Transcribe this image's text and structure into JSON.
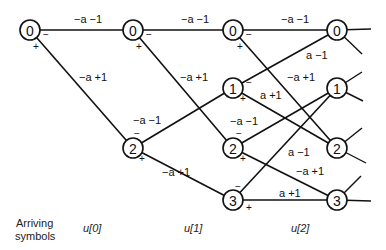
{
  "diagram": {
    "type": "trellis",
    "nodes": [
      {
        "id": "c0n0",
        "label": "0",
        "x": 30,
        "y": 30
      },
      {
        "id": "c1n0",
        "label": "0",
        "x": 133,
        "y": 30
      },
      {
        "id": "c1n2",
        "label": "2",
        "x": 133,
        "y": 148
      },
      {
        "id": "c2n0",
        "label": "0",
        "x": 233,
        "y": 30
      },
      {
        "id": "c2n1",
        "label": "1",
        "x": 233,
        "y": 88
      },
      {
        "id": "c2n2",
        "label": "2",
        "x": 233,
        "y": 148
      },
      {
        "id": "c2n3",
        "label": "3",
        "x": 233,
        "y": 200
      },
      {
        "id": "c3n0",
        "label": "0",
        "x": 337,
        "y": 30
      },
      {
        "id": "c3n1",
        "label": "1",
        "x": 337,
        "y": 88
      },
      {
        "id": "c3n2",
        "label": "2",
        "x": 337,
        "y": 148
      },
      {
        "id": "c3n3",
        "label": "3",
        "x": 337,
        "y": 200
      }
    ],
    "edges": [
      {
        "from": "c0n0",
        "to": "c1n0",
        "label": "−a −1"
      },
      {
        "from": "c0n0",
        "to": "c1n2",
        "label": "−a +1"
      },
      {
        "from": "c1n0",
        "to": "c2n0",
        "label": "−a −1"
      },
      {
        "from": "c1n0",
        "to": "c2n2",
        "label": "−a +1"
      },
      {
        "from": "c1n2",
        "to": "c2n1",
        "label": "−a −1"
      },
      {
        "from": "c1n2",
        "to": "c2n3",
        "label": "−a +1"
      },
      {
        "from": "c2n0",
        "to": "c3n0",
        "label": "−a −1"
      },
      {
        "from": "c2n0",
        "to": "c3n2",
        "label": "−a +1"
      },
      {
        "from": "c2n1",
        "to": "c3n0",
        "label": "a −1"
      },
      {
        "from": "c2n1",
        "to": "c3n2",
        "label": "a +1"
      },
      {
        "from": "c2n2",
        "to": "c3n1",
        "label": "−a −1"
      },
      {
        "from": "c2n2",
        "to": "c3n3",
        "label": "−a +1"
      },
      {
        "from": "c2n3",
        "to": "c3n1",
        "label": "a −1"
      },
      {
        "from": "c2n3",
        "to": "c3n3",
        "label": "a +1"
      }
    ],
    "signs": {
      "minus": "−",
      "plus": "+"
    },
    "footer": {
      "arriving_line1": "Arriving",
      "arriving_line2": "symbols",
      "u0": "u[0]",
      "u1": "u[1]",
      "u2": "u[2]"
    },
    "labels": {
      "e1": "−a −1",
      "e2": "−a +1",
      "e3": "−a −1",
      "e4": "−a +1",
      "e5": "−a −1",
      "e6": "−a +1",
      "e7": "−a −1",
      "e8": "a −1",
      "e9": "−a +1",
      "e10": "a +1",
      "e11": "−a −1",
      "e12": "a −1",
      "e13": "−a +1",
      "e14": "a +1"
    },
    "node_labels": {
      "c0n0": "0",
      "c1n0": "0",
      "c1n2": "2",
      "c2n0": "0",
      "c2n1": "1",
      "c2n2": "2",
      "c2n3": "3",
      "c3n0": "0",
      "c3n1": "1",
      "c3n2": "2",
      "c3n3": "3"
    }
  }
}
